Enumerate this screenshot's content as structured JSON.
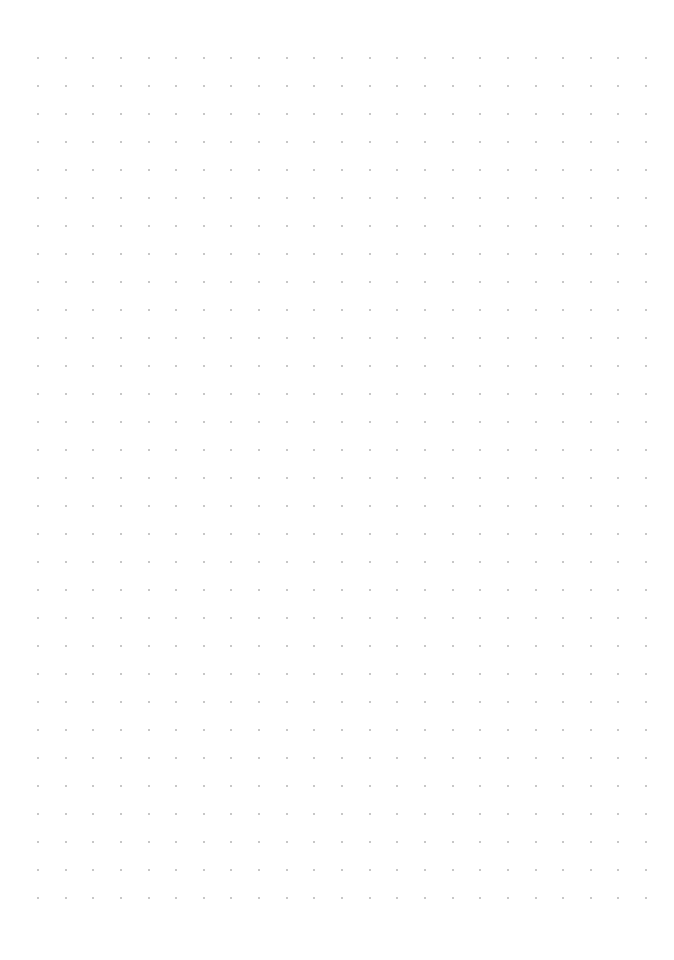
{
  "page": {
    "type": "dot-grid-paper",
    "background": "#ffffff",
    "dot_color": "#b4b4b4",
    "dot_size_px": 2
  },
  "grid": {
    "columns": 23,
    "rows": 31,
    "origin_x": 37,
    "origin_y": 57,
    "spacing_x": 27.64,
    "spacing_y": 28
  }
}
